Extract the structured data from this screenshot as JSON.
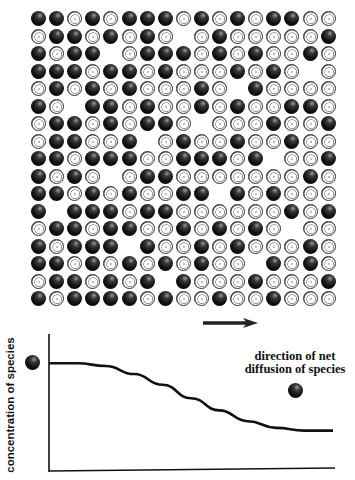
{
  "figure": {
    "grid": {
      "description": "Random mixture of black (solute species) and white ring particles; black particles more dense on left",
      "columns": 17,
      "rows": 17,
      "origin": {
        "x": 31,
        "y": 11
      },
      "spacing": {
        "x": 18.1,
        "y": 17.5
      },
      "legend": {
        "B": "black particle (species)",
        "W": "white ring particle",
        "_": "empty"
      },
      "cells": [
        "BBWBWBBBWBWBWBBWW",
        "WBBWBWBW_WBWWWWWB",
        "BWBB_WBBBWBWBWWBW",
        "BBBWBBWBWWWBWBW_W",
        "WBWBWBWWWBW_BWWWW",
        "BW_BBWBWWBWBWWBBW",
        "WBBWBWBBW_WWWBWWB",
        "WBBWWB_WBWWBWWBWW",
        "BBWBBBWWBBBWB_WWB",
        "BWBW_WBBWWWWWWWBW",
        "BBWBWBWWBB_BWBWWW",
        "B_BBBWBBWWWWWWBWB",
        "WBBWBBWWBWBWBW_WW",
        "BWBBB_BWWBWBWWWBW",
        "BBWBWBWBWBWW_BWBW",
        "WBBWBWB_BWWWBWWWB",
        "BWBBBBWBWWBWWBWWW"
      ]
    },
    "arrow": {
      "direction": "right",
      "meaning": "direction of net diffusion"
    },
    "annotation": {
      "line1": "direction of net",
      "line2": "diffusion of species"
    }
  },
  "chart_data": {
    "type": "line",
    "title": "",
    "xlabel": "",
    "ylabel": "concentration of species",
    "x": [
      0,
      0.1,
      0.2,
      0.3,
      0.4,
      0.5,
      0.6,
      0.7,
      0.8,
      0.9,
      1.0
    ],
    "series": [
      {
        "name": "concentration",
        "values": [
          0.8,
          0.8,
          0.78,
          0.72,
          0.64,
          0.54,
          0.45,
          0.37,
          0.32,
          0.3,
          0.3
        ]
      }
    ],
    "ylim": [
      0,
      1
    ],
    "xlim": [
      0,
      1
    ],
    "grid": false,
    "legend": "none",
    "annotations": [
      "direction of net diffusion of species"
    ],
    "markers": [
      {
        "label": "species particle (high side)",
        "position": "left of y-axis near top"
      },
      {
        "label": "species particle (low side)",
        "position": "right, above curve"
      }
    ]
  }
}
